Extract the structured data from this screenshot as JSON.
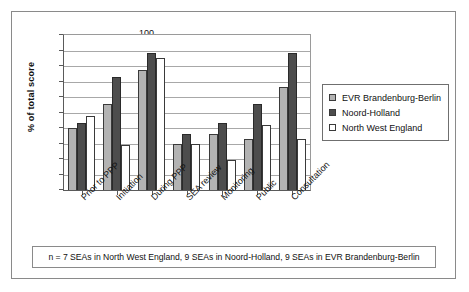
{
  "figure": {
    "ylabel": "% of total score",
    "footnote": "n = 7 SEAs in North West England, 9 SEAs in Noord-Holland, 9 SEAs in EVR Brandenburg-Berlin"
  },
  "legend": {
    "items": [
      {
        "label": "EVR Brandenburg-Berlin",
        "color": "#b3b3b3"
      },
      {
        "label": "Noord-Holland",
        "color": "#4d4d4d"
      },
      {
        "label": "North West England",
        "color": "#ffffff"
      }
    ]
  },
  "chart_data": {
    "type": "bar",
    "title": "",
    "xlabel": "",
    "ylabel": "% of total score",
    "ylim": [
      0,
      100
    ],
    "yticks": [
      0,
      10,
      20,
      30,
      40,
      50,
      60,
      70,
      80,
      90,
      100
    ],
    "ytick_labels": [
      "0",
      "10",
      "20",
      "30",
      "40",
      "50",
      "60",
      "70",
      "80",
      "90",
      "100"
    ],
    "grid": true,
    "legend_position": "right",
    "categories": [
      "Prior to PPP",
      "Initiation",
      "During PPP",
      "SEA review",
      "Monitoring",
      "Public",
      "Consultation"
    ],
    "series": [
      {
        "name": "EVR Brandenburg-Berlin",
        "color": "#b3b3b3",
        "values": [
          40.5,
          56,
          78,
          30,
          36.5,
          33,
          67
        ]
      },
      {
        "name": "Noord-Holland",
        "color": "#4d4d4d",
        "values": [
          43.5,
          73.5,
          89,
          36.5,
          43.5,
          56,
          89
        ]
      },
      {
        "name": "North West England",
        "color": "#ffffff",
        "values": [
          48,
          29.5,
          85.5,
          30,
          19.5,
          42.5,
          33
        ]
      }
    ]
  }
}
